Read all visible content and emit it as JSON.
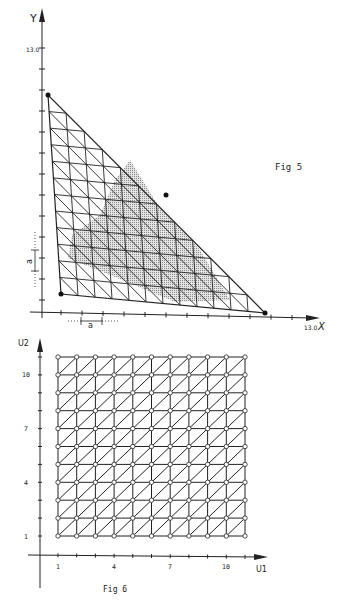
{
  "fig5": {
    "caption": "Fig 5",
    "y_axis_label": "Y",
    "x_axis_label": "X",
    "y_max_label": "13.0",
    "x_max_label": "13.0",
    "spacing_label_x": "a",
    "spacing_label_y": "a",
    "corner_points": [
      {
        "name": "top",
        "x": 48,
        "y": 95
      },
      {
        "name": "bottom-left",
        "x": 61,
        "y": 294
      },
      {
        "name": "bottom-right",
        "x": 265,
        "y": 313
      },
      {
        "name": "hypotenuse-mid",
        "x": 166,
        "y": 195
      }
    ],
    "mesh_divisions": 12
  },
  "fig6": {
    "caption": "Fig 6",
    "x_axis_label": "U1",
    "y_axis_label": "U2",
    "x_ticks": [
      "1",
      "4",
      "7",
      "10"
    ],
    "y_ticks": [
      "1",
      "4",
      "7",
      "10"
    ],
    "grid_nodes_per_side": 11
  },
  "colors": {
    "ink": "#222222",
    "shade": "#b8b8b8",
    "background": "#ffffff"
  }
}
